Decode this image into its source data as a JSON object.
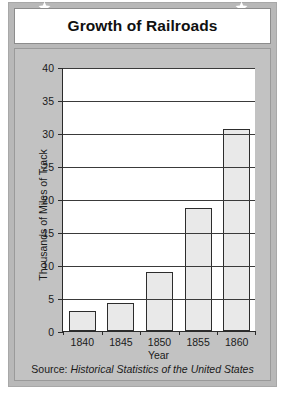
{
  "title": "Growth of Railroads",
  "decorations": {
    "star_left": "star-icon",
    "star_right": "star-icon"
  },
  "source": {
    "prefix": "Source: ",
    "citation": "Historical Statistics of the United States"
  },
  "colors": {
    "frame": "#b8b8b8",
    "panel": "#c2c2c2",
    "plot_background": "#ffffff",
    "bar_fill": "#e9e9e9",
    "bar_outline": "#2d2d2d",
    "axis": "#2b2b2b",
    "text": "#1a1a1a"
  },
  "chart_data": {
    "type": "bar",
    "title": "Growth of Railroads",
    "categories": [
      "1840",
      "1845",
      "1850",
      "1855",
      "1860"
    ],
    "values": [
      3.0,
      4.3,
      9.0,
      18.7,
      30.6
    ],
    "xlabel": "Year",
    "ylabel": "Thousands of Miles of Track",
    "ylim": [
      0,
      40
    ],
    "yticks": [
      0,
      5,
      10,
      15,
      20,
      25,
      30,
      35,
      40
    ],
    "ytick_labels": [
      "0",
      "5",
      "10",
      "15",
      "20",
      "25",
      "30",
      "35",
      "40"
    ],
    "grid": true,
    "grid_axis": "y",
    "legend": false,
    "source": "Source: Historical Statistics of the United States"
  }
}
